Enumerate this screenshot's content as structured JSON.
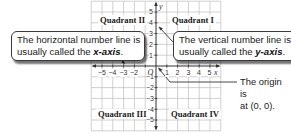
{
  "diagram": {
    "quadrants": {
      "q1": "Quadrant I",
      "q2": "Quadrant II",
      "q3": "Quadrant III",
      "q4": "Quadrant IV"
    },
    "axes": {
      "x_label": "x",
      "y_label": "y",
      "origin_label": "O",
      "x_ticks": [
        "−5",
        "−4",
        "−3",
        "−2",
        "1",
        "2",
        "3",
        "4",
        "5"
      ],
      "y_ticks_positive": [
        "5",
        "4",
        "3",
        "2",
        "1"
      ],
      "y_ticks_negative": [
        "−1",
        "−2",
        "−3",
        "−4",
        "−5"
      ],
      "range": [
        -6,
        6
      ]
    },
    "callouts": {
      "x_axis": {
        "line1": "The horizontal number line is",
        "line2_prefix": "usually called the ",
        "term": "x-axis",
        "suffix": "."
      },
      "y_axis": {
        "line1": "The vertical number line is",
        "line2_prefix": "usually called the ",
        "term": "y-axis",
        "suffix": "."
      },
      "origin": {
        "line1": "The origin is",
        "line2": "at (0, 0)."
      }
    },
    "colors": {
      "grid": "#b8b8b8",
      "axis": "#333333",
      "callout_border": "#3a3a3a",
      "text": "#222222"
    }
  }
}
